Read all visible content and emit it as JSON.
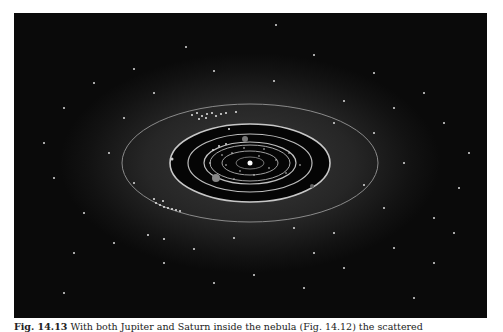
{
  "figure": {
    "colors": {
      "background": "#0a0a0a",
      "nebula": "#3a3a3a",
      "inner_disk": "#050505",
      "orbit": "#bdbdbd",
      "bodies": "#e6e6e6"
    }
  },
  "caption": {
    "label": "Fig. 14.13",
    "text": "With both Jupiter and Saturn inside the nebula (Fig. 14.12) the scattered"
  }
}
